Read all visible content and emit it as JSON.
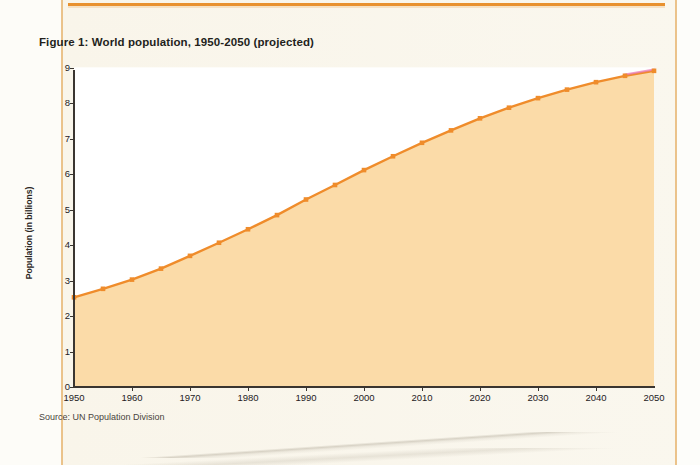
{
  "document": {
    "figure_title": "Figure 1: World population, 1950-2050 (projected)",
    "source_note": "Source: UN Population Division"
  },
  "colors": {
    "line": "#ef8c2b",
    "fill": "#fbdba8",
    "marker": "#ef8c2b",
    "projection_line": "#e87ab4",
    "rule": "#e8912f",
    "page": "#faf6ec",
    "plot_background": "#ffffff",
    "gridline": "#ffffff",
    "axis": "#3a3530",
    "text": "#231f1c"
  },
  "chart_data": {
    "type": "area",
    "title": "Figure 1: World population, 1950-2050 (projected)",
    "xlabel": "",
    "ylabel": "Population (in billions)",
    "xlim": [
      1950,
      2050
    ],
    "ylim": [
      0,
      9
    ],
    "grid": true,
    "grid_axis": "y",
    "legend": false,
    "source": "Source: UN Population Division",
    "xticks": [
      1950,
      1960,
      1970,
      1980,
      1990,
      2000,
      2010,
      2020,
      2030,
      2040,
      2050
    ],
    "xtick_labels": [
      "1950",
      "1960",
      "1970",
      "1980",
      "1990",
      "2000",
      "2010",
      "2020",
      "2030",
      "2040",
      "2050"
    ],
    "yticks": [
      0,
      1,
      2,
      3,
      4,
      5,
      6,
      7,
      8,
      9
    ],
    "ytick_labels": [
      "0",
      "1",
      "2",
      "3",
      "4",
      "5",
      "6",
      "7",
      "8",
      "9"
    ],
    "marker_interval_years": 5,
    "series": [
      {
        "name": "World population",
        "unit": "billions",
        "x": [
          1950,
          1955,
          1960,
          1965,
          1970,
          1975,
          1980,
          1985,
          1990,
          1995,
          2000,
          2005,
          2010,
          2015,
          2020,
          2025,
          2030,
          2035,
          2040,
          2045,
          2050
        ],
        "values": [
          2.53,
          2.77,
          3.03,
          3.34,
          3.7,
          4.07,
          4.45,
          4.85,
          5.29,
          5.7,
          6.12,
          6.51,
          6.89,
          7.24,
          7.58,
          7.88,
          8.15,
          8.39,
          8.6,
          8.78,
          8.92
        ]
      }
    ],
    "projection_segment": {
      "note": "faint magenta overlay on final segment",
      "from_year": 2045,
      "to_year": 2050
    }
  }
}
